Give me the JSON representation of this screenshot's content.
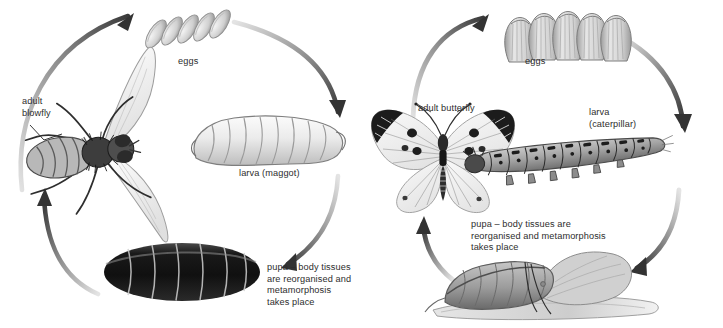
{
  "diagram": {
    "background_color": "#ffffff",
    "ink_color": "#2d2d2d",
    "arrow_dark": "#3a3a3a",
    "arrow_light": "#d8d8d8"
  },
  "cycles": [
    {
      "id": "blowfly",
      "name": "blowfly life cycle",
      "stages": [
        {
          "key": "adult",
          "label": "adult\nblowfly",
          "icon": "blowfly-icon"
        },
        {
          "key": "eggs",
          "label": "eggs",
          "icon": "fly-eggs-icon",
          "count": 5
        },
        {
          "key": "larva",
          "label": "larva (maggot)",
          "icon": "maggot-icon"
        },
        {
          "key": "pupa",
          "label": "pupa – body tissues\nare reorganised and\nmetamorphosis\ntakes place",
          "icon": "fly-pupa-icon"
        }
      ],
      "arrows": [
        {
          "from": "adult",
          "to": "eggs"
        },
        {
          "from": "eggs",
          "to": "larva"
        },
        {
          "from": "larva",
          "to": "pupa"
        },
        {
          "from": "pupa",
          "to": "adult"
        }
      ]
    },
    {
      "id": "butterfly",
      "name": "butterfly life cycle",
      "stages": [
        {
          "key": "adult",
          "label": "adult butterfly",
          "icon": "butterfly-icon"
        },
        {
          "key": "eggs",
          "label": "eggs",
          "icon": "butterfly-eggs-icon",
          "count": 5
        },
        {
          "key": "larva",
          "label": "larva\n(caterpillar)",
          "icon": "caterpillar-icon"
        },
        {
          "key": "pupa",
          "label": "pupa – body tissues are\nreorganised and metamorphosis\ntakes place",
          "icon": "chrysalis-icon"
        }
      ],
      "arrows": [
        {
          "from": "adult",
          "to": "eggs"
        },
        {
          "from": "eggs",
          "to": "larva"
        },
        {
          "from": "larva",
          "to": "pupa"
        },
        {
          "from": "pupa",
          "to": "adult"
        }
      ]
    }
  ],
  "labels": {
    "fly_adult": "adult\nblowfly",
    "fly_eggs": "eggs",
    "fly_larva": "larva (maggot)",
    "fly_pupa": "pupa – body tissues\nare reorganised and\nmetamorphosis\ntakes place",
    "bf_adult": "adult butterfly",
    "bf_eggs": "eggs",
    "bf_larva": "larva\n(caterpillar)",
    "bf_pupa": "pupa – body tissues are\nreorganised and metamorphosis\ntakes place"
  }
}
